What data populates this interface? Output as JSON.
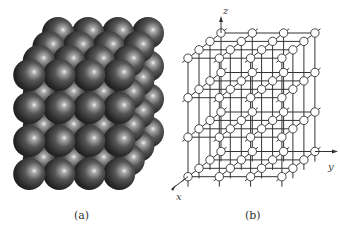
{
  "figure": {
    "panels": [
      {
        "id": "a",
        "caption": "(a)",
        "description": "Simple cubic packing of spheres",
        "grid": {
          "nx": 4,
          "ny": 4,
          "nz": 4
        },
        "geometry": {
          "back_top_left": [
            58,
            33
          ],
          "x_step": [
            30,
            0
          ],
          "depth_step": [
            -9.6,
            14
          ],
          "z_step": [
            0,
            33
          ],
          "radius": 16
        },
        "colors": {
          "sphere_dark": "#1a1a1a",
          "sphere_mid": "#555555",
          "highlight": "#f0f0f0"
        }
      },
      {
        "id": "b",
        "caption": "(b)",
        "description": "Simple cubic lattice with nodes and axes",
        "grid": {
          "nx": 4,
          "ny": 4,
          "nz": 4
        },
        "geometry": {
          "back_top_left": [
            221,
            33
          ],
          "x_step": [
            31.3,
            0
          ],
          "depth_step": [
            -11,
            8.4
          ],
          "z_step": [
            0,
            39.5
          ],
          "node_radius": 4.2
        },
        "axes": {
          "z": {
            "label": "z",
            "label_pos": [
              223,
              14
            ]
          },
          "y": {
            "label": "y",
            "label_pos": [
              328,
              170
            ]
          },
          "x": {
            "label": "x",
            "label_pos": [
              176,
              200
            ]
          }
        },
        "colors": {
          "line": "#333333",
          "node_fill": "#ffffff",
          "node_stroke": "#333333"
        }
      }
    ]
  }
}
